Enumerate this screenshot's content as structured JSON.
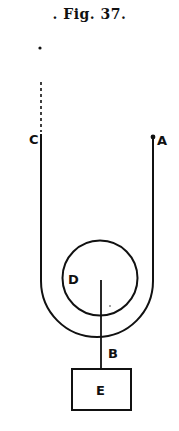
{
  "figure": {
    "caption": ". Fig. 37.",
    "labels": {
      "A": "A",
      "B": "B",
      "C": "C",
      "D": "D",
      "E": "E"
    }
  },
  "colors": {
    "ink": "#111111",
    "background": "#ffffff"
  }
}
